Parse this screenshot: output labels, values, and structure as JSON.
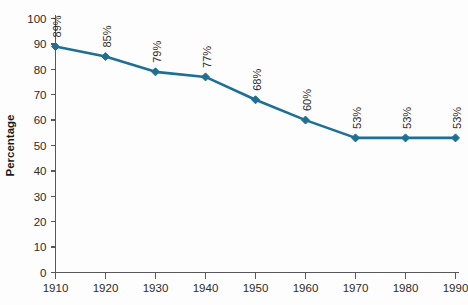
{
  "chart_data": {
    "type": "line",
    "title": "",
    "subtitle": "",
    "xlabel": "",
    "ylabel": "Percentage",
    "categories": [
      "1910",
      "1920",
      "1930",
      "1940",
      "1950",
      "1960",
      "1970",
      "1980",
      "1990"
    ],
    "x": [
      1910,
      1920,
      1930,
      1940,
      1950,
      1960,
      1970,
      1980,
      1990
    ],
    "values": [
      89,
      85,
      79,
      77,
      68,
      60,
      53,
      53,
      53
    ],
    "point_labels": [
      "89%",
      "85%",
      "79%",
      "77%",
      "68%",
      "60%",
      "53%",
      "53%",
      "53%"
    ],
    "ylim": [
      0,
      100
    ],
    "xlim": [
      1910,
      1990
    ],
    "yticks": [
      0,
      10,
      20,
      30,
      40,
      50,
      60,
      70,
      80,
      90,
      100
    ],
    "ytick_labels": [
      "0",
      "10",
      "20",
      "30",
      "40",
      "50",
      "60",
      "70",
      "80",
      "90",
      "100"
    ],
    "xticks": [
      1910,
      1920,
      1930,
      1940,
      1950,
      1960,
      1970,
      1980,
      1990
    ],
    "xtick_labels": [
      "1910",
      "1920",
      "1930",
      "1940",
      "1950",
      "1960",
      "1970",
      "1980",
      "1990"
    ],
    "grid": false,
    "legend": false,
    "legend_position": "none",
    "series": [
      {
        "name": "Percentage",
        "color": "#1d6f95",
        "marker": "diamond",
        "values": [
          89,
          85,
          79,
          77,
          68,
          60,
          53,
          53,
          53
        ]
      }
    ],
    "colors": {
      "line": "#1d6f95",
      "marker": "#1d6f95",
      "axis": "#58585a",
      "text": "#2b2b2b",
      "background": "#fdfdfd"
    },
    "point_label_rotation": -90
  }
}
